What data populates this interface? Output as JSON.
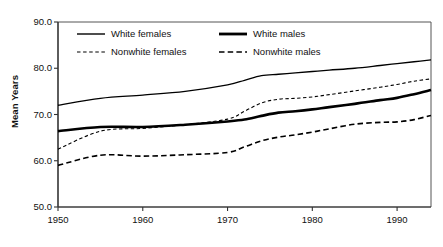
{
  "chart_data": {
    "type": "line",
    "title": "",
    "subtitle": "",
    "xlabel": "",
    "ylabel": "Mean Years",
    "xlim": [
      1950,
      1994
    ],
    "ylim": [
      50.0,
      90.0
    ],
    "grid": false,
    "legend_position": "top-left-inside",
    "x_ticks": [
      "1950",
      "1960",
      "1970",
      "1980",
      "1990"
    ],
    "x_tick_values": [
      1950,
      1960,
      1970,
      1980,
      1990
    ],
    "y_ticks": [
      "50.0",
      "60.0",
      "70.0",
      "80.0",
      "90.0"
    ],
    "y_tick_values": [
      50.0,
      60.0,
      70.0,
      80.0,
      90.0
    ],
    "x": [
      1950,
      1955,
      1960,
      1965,
      1970,
      1972,
      1974,
      1976,
      1978,
      1980,
      1982,
      1985,
      1988,
      1990,
      1992,
      1994
    ],
    "series": [
      {
        "name": "White females",
        "style": "solid-thin",
        "color": "#000000",
        "width": 1.3,
        "values": [
          72.0,
          73.5,
          74.2,
          75.0,
          76.4,
          77.4,
          78.4,
          78.7,
          79.0,
          79.3,
          79.6,
          80.0,
          80.6,
          81.0,
          81.4,
          81.8
        ]
      },
      {
        "name": "White males",
        "style": "solid-thick",
        "color": "#000000",
        "width": 2.6,
        "values": [
          66.4,
          67.3,
          67.3,
          67.8,
          68.5,
          68.9,
          69.7,
          70.4,
          70.7,
          71.1,
          71.6,
          72.3,
          73.1,
          73.6,
          74.4,
          75.3
        ]
      },
      {
        "name": "Nonwhite females",
        "style": "dashed-fine",
        "color": "#000000",
        "width": 1.1,
        "values": [
          62.5,
          66.4,
          67.0,
          67.8,
          69.0,
          70.7,
          72.5,
          73.3,
          73.5,
          73.8,
          74.3,
          75.1,
          75.9,
          76.5,
          77.2,
          77.7
        ]
      },
      {
        "name": "Nonwhite males",
        "style": "dashed-coarse",
        "color": "#000000",
        "width": 1.6,
        "values": [
          59.0,
          61.2,
          61.0,
          61.3,
          61.8,
          63.0,
          64.3,
          65.1,
          65.6,
          66.2,
          66.9,
          67.9,
          68.3,
          68.4,
          68.9,
          69.8
        ]
      }
    ]
  },
  "axes": {
    "ylabel": "Mean Years"
  },
  "legend": {
    "items": [
      {
        "label": "White females",
        "style": "solid-thin"
      },
      {
        "label": "White males",
        "style": "solid-thick"
      },
      {
        "label": "Nonwhite females",
        "style": "dashed-fine"
      },
      {
        "label": "Nonwhite males",
        "style": "dashed-coarse"
      }
    ]
  }
}
